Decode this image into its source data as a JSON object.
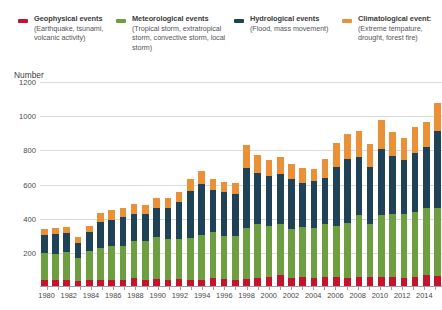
{
  "legend": {
    "items": [
      {
        "title": "Geophysical events",
        "sub": "(Earthquake, tsunami, volcanic activity)",
        "color": "#c4122f",
        "name": "geophysical"
      },
      {
        "title": "Meteorological events",
        "sub": "(Tropical storm, extratropical storm, convective storm, local storm)",
        "color": "#6d9e3f",
        "name": "meteorological"
      },
      {
        "title": "Hydrological events",
        "sub": "(Flood, mass movement)",
        "color": "#1f4257",
        "name": "hydrological"
      },
      {
        "title": "Climatological event:",
        "sub": "(Extreme tempature, drought, forest fire)",
        "color": "#ea9036",
        "name": "climatological"
      }
    ]
  },
  "axis": {
    "y_title": "Number",
    "y_ticks": [
      1200,
      1000,
      800,
      600,
      400,
      200
    ],
    "y_min": 0,
    "y_max": 1200,
    "x_tick_labels": [
      "1980",
      "1982",
      "1984",
      "1986",
      "1988",
      "1990",
      "1992",
      "1994",
      "1996",
      "1998",
      "2000",
      "2002",
      "2004",
      "2006",
      "2008",
      "2010",
      "2012",
      "2014"
    ]
  },
  "chart_data": {
    "type": "bar",
    "title": "Number",
    "subtype": "stacked",
    "xlabel": "",
    "ylabel": "Number",
    "ylim": [
      0,
      1200
    ],
    "ytick_step": 200,
    "grid": true,
    "legend_position": "top",
    "categories": [
      "1980",
      "1981",
      "1982",
      "1983",
      "1984",
      "1985",
      "1986",
      "1987",
      "1988",
      "1989",
      "1990",
      "1991",
      "1992",
      "1993",
      "1994",
      "1995",
      "1996",
      "1997",
      "1998",
      "1999",
      "2000",
      "2001",
      "2002",
      "2003",
      "2004",
      "2005",
      "2006",
      "2007",
      "2008",
      "2009",
      "2010",
      "2011",
      "2012",
      "2013",
      "2014",
      "2015"
    ],
    "series": [
      {
        "name": "Geophysical events",
        "color": "#c4122f",
        "values": [
          40,
          40,
          40,
          35,
          40,
          40,
          40,
          40,
          50,
          40,
          45,
          40,
          45,
          40,
          40,
          50,
          45,
          40,
          45,
          50,
          60,
          70,
          50,
          60,
          55,
          60,
          60,
          55,
          60,
          60,
          60,
          60,
          55,
          60,
          70,
          65
        ]
      },
      {
        "name": "Meteorological events",
        "color": "#6d9e3f",
        "values": [
          160,
          155,
          165,
          135,
          170,
          190,
          200,
          200,
          220,
          230,
          250,
          240,
          235,
          245,
          265,
          270,
          255,
          260,
          300,
          320,
          300,
          300,
          290,
          290,
          290,
          310,
          300,
          320,
          360,
          310,
          360,
          370,
          370,
          380,
          390,
          400
        ]
      },
      {
        "name": "Hydrological events",
        "color": "#1f4257",
        "values": [
          105,
          115,
          110,
          90,
          115,
          150,
          155,
          170,
          160,
          155,
          170,
          180,
          215,
          280,
          300,
          250,
          255,
          245,
          350,
          300,
          290,
          290,
          290,
          260,
          275,
          270,
          340,
          375,
          340,
          330,
          390,
          335,
          320,
          345,
          360,
          450
        ]
      },
      {
        "name": "Climatological events",
        "color": "#ea9036",
        "values": [
          35,
          35,
          35,
          30,
          35,
          55,
          55,
          55,
          55,
          55,
          55,
          60,
          60,
          70,
          75,
          65,
          60,
          65,
          135,
          100,
          95,
          100,
          90,
          85,
          70,
          110,
          145,
          145,
          155,
          140,
          170,
          145,
          130,
          150,
          145,
          160
        ]
      }
    ],
    "totals": [
      340,
      345,
      350,
      290,
      360,
      435,
      450,
      465,
      485,
      480,
      520,
      520,
      555,
      635,
      680,
      635,
      615,
      610,
      830,
      770,
      745,
      760,
      720,
      695,
      690,
      750,
      845,
      895,
      915,
      840,
      980,
      910,
      875,
      935,
      965,
      1075
    ]
  }
}
